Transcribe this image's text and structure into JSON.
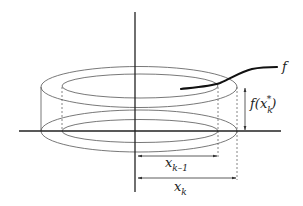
{
  "figure": {
    "type": "cylindrical-shell-diagram",
    "labels": {
      "function": "f",
      "height_label_main": "f(x",
      "height_label_sub": "k",
      "height_label_sup": "*",
      "height_label_close": ")",
      "inner_radius_main": "x",
      "inner_radius_sub": "k–1",
      "outer_radius_main": "x",
      "outer_radius_sub": "k"
    },
    "colors": {
      "line": "#555555",
      "axis": "#222222",
      "curve": "#111111",
      "background": "#ffffff"
    }
  }
}
